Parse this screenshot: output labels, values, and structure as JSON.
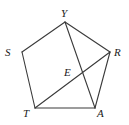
{
  "figure": {
    "name": "pentagon-with-diagonals",
    "width": 129,
    "height": 125,
    "background_color": "#ffffff",
    "stroke_color": "#3a3a3a",
    "label_color": "#1a1a1a",
    "stroke_width": 1.1,
    "vertices": [
      {
        "label": "Y",
        "x": 65,
        "y": 22,
        "label_x": 61,
        "label_y": 8
      },
      {
        "label": "S",
        "x": 22,
        "y": 52,
        "label_x": 5,
        "label_y": 47
      },
      {
        "label": "R",
        "x": 110,
        "y": 52,
        "label_x": 114,
        "label_y": 47
      },
      {
        "label": "T",
        "x": 35,
        "y": 108,
        "label_x": 23,
        "label_y": 108
      },
      {
        "label": "A",
        "x": 95,
        "y": 108,
        "label_x": 97,
        "label_y": 108
      }
    ],
    "interior_points": [
      {
        "label": "E",
        "x": 76,
        "y": 78,
        "label_x": 64,
        "label_y": 67
      }
    ],
    "edges": [
      {
        "name": "edge-S-Y",
        "from": "S",
        "to": "Y"
      },
      {
        "name": "edge-Y-R",
        "from": "Y",
        "to": "R"
      },
      {
        "name": "edge-R-A",
        "from": "R",
        "to": "A"
      },
      {
        "name": "edge-A-T",
        "from": "A",
        "to": "T"
      },
      {
        "name": "edge-T-S",
        "from": "T",
        "to": "S"
      }
    ],
    "diagonals": [
      {
        "name": "diagonal-T-R",
        "from": "T",
        "to": "R"
      },
      {
        "name": "diagonal-Y-A",
        "from": "Y",
        "to": "A"
      }
    ]
  }
}
